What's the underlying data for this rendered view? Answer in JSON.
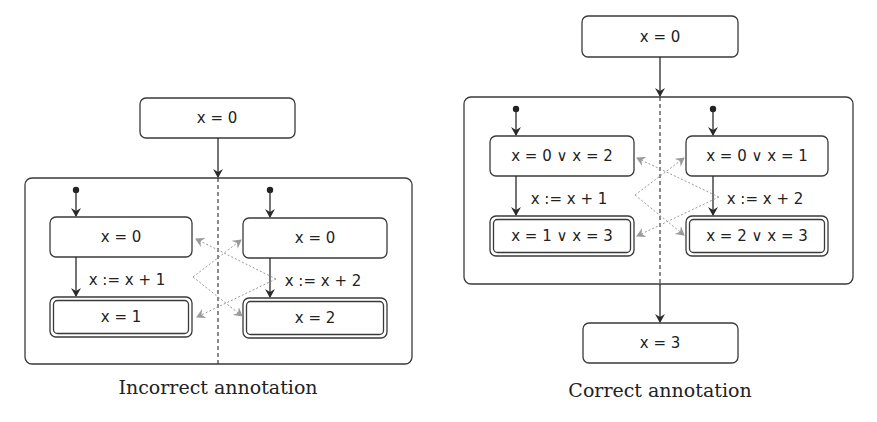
{
  "incorrect": {
    "caption": "Incorrect annotation",
    "precondition": "x = 0",
    "left_thread": {
      "pre": "x = 0",
      "statement": "x := x + 1",
      "post": "x = 1"
    },
    "right_thread": {
      "pre": "x = 0",
      "statement": "x := x + 2",
      "post": "x = 2"
    }
  },
  "correct": {
    "caption": "Correct annotation",
    "precondition": "x = 0",
    "left_thread": {
      "pre": "x = 0 ∨ x = 2",
      "statement": "x := x + 1",
      "post": "x = 1 ∨ x = 3"
    },
    "right_thread": {
      "pre": "x = 0 ∨ x = 1",
      "statement": "x := x + 2",
      "post": "x = 2 ∨ x = 3"
    },
    "postcondition": "x = 3"
  },
  "colors": {
    "stroke": "#3a3a3a",
    "interference_arrows": "#9a9a9a",
    "background": "#ffffff"
  }
}
